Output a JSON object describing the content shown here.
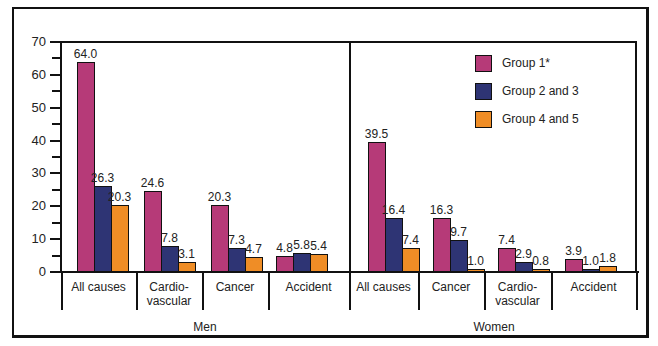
{
  "chart_data": {
    "type": "bar",
    "title": "",
    "xlabel": "",
    "ylabel": "",
    "ylim": [
      0,
      70
    ],
    "yticks": [
      0,
      10,
      20,
      30,
      40,
      50,
      60,
      70
    ],
    "grid": false,
    "legend_position": "upper right inside",
    "groups": [
      {
        "name": "Men",
        "categories": [
          "All causes",
          "Cardio-vascular",
          "Cancer",
          "Accident"
        ],
        "series": [
          {
            "name": "Group 1*",
            "values": [
              64.0,
              24.6,
              20.3,
              4.8
            ]
          },
          {
            "name": "Group 2 and 3",
            "values": [
              26.3,
              7.8,
              7.3,
              5.8
            ]
          },
          {
            "name": "Group 4 and 5",
            "values": [
              20.3,
              3.1,
              4.7,
              5.4
            ]
          }
        ]
      },
      {
        "name": "Women",
        "categories": [
          "All causes",
          "Cancer",
          "Cardio-vascular",
          "Accident"
        ],
        "series": [
          {
            "name": "Group 1*",
            "values": [
              39.5,
              16.3,
              7.4,
              3.9
            ]
          },
          {
            "name": "Group 2 and 3",
            "values": [
              16.4,
              9.7,
              2.9,
              1.0
            ]
          },
          {
            "name": "Group 4 and 5",
            "values": [
              7.4,
              1.0,
              0.8,
              1.8
            ]
          }
        ]
      }
    ],
    "legend": [
      "Group 1*",
      "Group 2 and 3",
      "Group 4 and 5"
    ],
    "colors": {
      "Group 1*": "#b63a78",
      "Group 2 and 3": "#2e3474",
      "Group 4 and 5": "#ef8d26"
    }
  },
  "labels": {
    "men": "Men",
    "women": "Women",
    "men_cats": [
      [
        "All causes"
      ],
      [
        "Cardio-",
        "vascular"
      ],
      [
        "Cancer"
      ],
      [
        "Accident"
      ]
    ],
    "women_cats": [
      [
        "All causes"
      ],
      [
        "Cancer"
      ],
      [
        "Cardio-",
        "vascular"
      ],
      [
        "Accident"
      ]
    ]
  },
  "value_labels": {
    "men": [
      [
        "64.0",
        "26.3",
        "20.3"
      ],
      [
        "24.6",
        "7.8",
        "3.1"
      ],
      [
        "20.3",
        "7.3",
        "4.7"
      ],
      [
        "4.8",
        "5.8",
        "5.4"
      ]
    ],
    "women": [
      [
        "39.5",
        "16.4",
        "7.4"
      ],
      [
        "16.3",
        "9.7",
        "1.0"
      ],
      [
        "7.4",
        "2.9",
        "0.8"
      ],
      [
        "3.9",
        "1.0",
        "1.8"
      ]
    ]
  }
}
